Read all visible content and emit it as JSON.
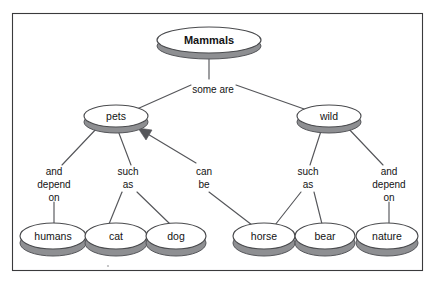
{
  "diagram": {
    "type": "concept-map",
    "background_color": "#ffffff",
    "frame_color": "#3a3a3c",
    "node_fill": "#ffffff",
    "node_stroke": "#4a4b4e",
    "node_shadow_color": "#8e8f92",
    "edge_color": "#55565a",
    "text_color": "#131314",
    "frame": {
      "x": 12,
      "y": 13,
      "width": 411,
      "height": 258
    },
    "nodes": [
      {
        "id": "mammals",
        "label": "Mammals",
        "cx": 209,
        "cy": 40,
        "rx": 52,
        "ry": 13,
        "bold": true
      },
      {
        "id": "pets",
        "label": "pets",
        "cx": 116,
        "cy": 116,
        "rx": 32,
        "ry": 11,
        "bold": false
      },
      {
        "id": "wild",
        "label": "wild",
        "cx": 329,
        "cy": 116,
        "rx": 32,
        "ry": 11,
        "bold": false
      },
      {
        "id": "humans",
        "label": "humans",
        "cx": 53,
        "cy": 236,
        "rx": 33,
        "ry": 13,
        "bold": false
      },
      {
        "id": "cat",
        "label": "cat",
        "cx": 116,
        "cy": 236,
        "rx": 31,
        "ry": 13,
        "bold": false
      },
      {
        "id": "dog",
        "label": "dog",
        "cx": 176,
        "cy": 236,
        "rx": 30,
        "ry": 13,
        "bold": false
      },
      {
        "id": "horse",
        "label": "horse",
        "cx": 264,
        "cy": 236,
        "rx": 31,
        "ry": 13,
        "bold": false
      },
      {
        "id": "bear",
        "label": "bear",
        "cx": 325,
        "cy": 236,
        "rx": 30,
        "ry": 13,
        "bold": false
      },
      {
        "id": "nature",
        "label": "nature",
        "cx": 387,
        "cy": 236,
        "rx": 31,
        "ry": 13,
        "bold": false
      }
    ],
    "edge_labels": [
      {
        "id": "some-are",
        "lines": [
          "some are"
        ],
        "x": 213,
        "y": 90
      },
      {
        "id": "and-depend-on-left",
        "lines": [
          "and",
          "depend",
          "on"
        ],
        "x": 54,
        "y": 178
      },
      {
        "id": "such-as-left",
        "lines": [
          "such",
          "as"
        ],
        "x": 128,
        "y": 178
      },
      {
        "id": "can-be",
        "lines": [
          "can",
          "be"
        ],
        "x": 204,
        "y": 178
      },
      {
        "id": "such-as-right",
        "lines": [
          "such",
          "as"
        ],
        "x": 308,
        "y": 178
      },
      {
        "id": "and-depend-on-right",
        "lines": [
          "and",
          "depend",
          "on"
        ],
        "x": 389,
        "y": 178
      }
    ],
    "edges": [
      {
        "id": "mammals-to-someare",
        "from": "mammals",
        "to": "some-are",
        "points": "209,56 209,79"
      },
      {
        "id": "someare-to-pets",
        "from": "some-are",
        "to": "pets",
        "points": "191,85 137,109"
      },
      {
        "id": "someare-to-wild",
        "from": "some-are",
        "to": "wild",
        "points": "236,85 307,110"
      },
      {
        "id": "pets-to-anddepend",
        "from": "pets",
        "to": "and-depend-on-left",
        "points": "98,127 62,165"
      },
      {
        "id": "pets-to-suchas",
        "from": "pets",
        "to": "such-as-left",
        "points": "117,128 131,165"
      },
      {
        "id": "canbe-to-pets",
        "from": "can-be",
        "to": "pets",
        "points": "196,163 142,131",
        "arrow": true
      },
      {
        "id": "anddepend-to-humans",
        "from": "and-depend-on-left",
        "to": "humans",
        "points": "54,202 54,223"
      },
      {
        "id": "suchas-to-cat",
        "from": "such-as-left",
        "to": "cat",
        "points": "122,192 109,224"
      },
      {
        "id": "suchas-to-dog",
        "from": "such-as-left",
        "to": "dog",
        "points": "137,192 170,224"
      },
      {
        "id": "canbe-to-horse",
        "from": "can-be",
        "to": "horse",
        "points": "209,192 252,225"
      },
      {
        "id": "wild-to-suchas",
        "from": "wild",
        "to": "such-as-right",
        "points": "322,128 310,165"
      },
      {
        "id": "wild-to-anddepend",
        "from": "wild",
        "to": "and-depend-on-right",
        "points": "347,127 383,165"
      },
      {
        "id": "suchasright-to-horse",
        "from": "such-as-right",
        "to": "horse",
        "points": "301,192 275,225"
      },
      {
        "id": "suchasright-to-bear",
        "from": "such-as-right",
        "to": "bear",
        "points": "314,192 322,224"
      },
      {
        "id": "anddependright-to-nature",
        "from": "and-depend-on-right",
        "to": "nature",
        "points": "389,202 389,223"
      }
    ]
  }
}
